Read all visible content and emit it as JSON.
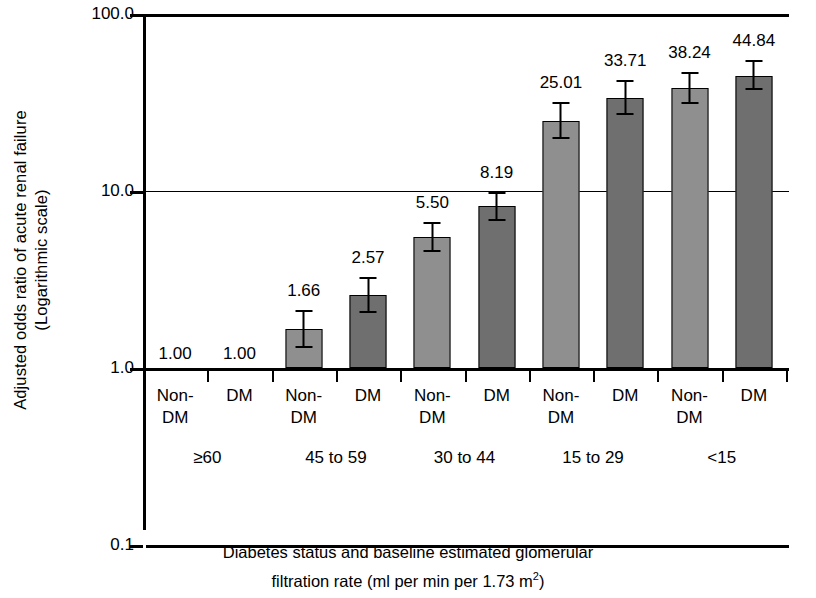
{
  "chart_data": {
    "type": "bar",
    "title": "",
    "xlabel": "Diabetes status and baseline estimated glomerular filtration rate (ml per min per 1.73 m2)",
    "ylabel": "Adjusted odds ratio of acute renal failure (Logarithmic scale)",
    "scale": "log",
    "ylim": [
      0.1,
      100.0
    ],
    "ytick_labels": [
      "100.0",
      "10.0",
      "1.0",
      "0.1"
    ],
    "ytick_values": [
      100.0,
      10.0,
      1.0,
      0.1
    ],
    "grid": true,
    "legend": "none",
    "categories": [
      "Non-DM",
      "DM",
      "Non-DM",
      "DM",
      "Non-DM",
      "DM",
      "Non-DM",
      "DM",
      "Non-DM",
      "DM"
    ],
    "values": [
      1.0,
      1.0,
      1.66,
      2.57,
      5.5,
      8.19,
      25.01,
      33.71,
      38.24,
      44.84
    ],
    "value_labels": [
      "1.00",
      "1.00",
      "1.66",
      "2.57",
      "5.50",
      "8.19",
      "25.01",
      "33.71",
      "38.24",
      "44.84"
    ],
    "error_low": [
      null,
      null,
      1.3,
      2.05,
      4.55,
      6.8,
      19.6,
      27.0,
      31.2,
      37.0
    ],
    "error_high": [
      null,
      null,
      2.12,
      3.25,
      6.7,
      9.9,
      32.0,
      42.5,
      47.0,
      55.0
    ],
    "groups": [
      {
        "label": "≥60",
        "categories": [
          "Non-DM",
          "DM"
        ]
      },
      {
        "label": "45 to 59",
        "categories": [
          "Non-DM",
          "DM"
        ]
      },
      {
        "label": "30 to 44",
        "categories": [
          "Non-DM",
          "DM"
        ]
      },
      {
        "label": "15 to 29",
        "categories": [
          "Non-DM",
          "DM"
        ]
      },
      {
        "label": "<15",
        "categories": [
          "Non-DM",
          "DM"
        ]
      }
    ],
    "colors": {
      "non_dm": "#8f8f8f",
      "dm": "#6f6f6f",
      "axis": "#000000"
    }
  },
  "axes": {
    "y_title_line1": "Adjusted odds ratio of acute renal failure",
    "y_title_line2": "(Logarithmic scale)",
    "x_title_line1": "Diabetes status and baseline estimated glomerular",
    "x_title_line2_a": "filtration rate (ml per min per 1.73 m",
    "x_title_line2_sup": "2",
    "x_title_line2_b": ")",
    "ytick_0": "100.0",
    "ytick_1": "10.0",
    "ytick_2": "1.0",
    "ytick_3": "0.1"
  },
  "cat_labels": [
    {
      "line1": "Non-",
      "line2": "DM"
    },
    {
      "line1": "DM",
      "line2": ""
    },
    {
      "line1": "Non-",
      "line2": "DM"
    },
    {
      "line1": "DM",
      "line2": ""
    },
    {
      "line1": "Non-",
      "line2": "DM"
    },
    {
      "line1": "DM",
      "line2": ""
    },
    {
      "line1": "Non-",
      "line2": "DM"
    },
    {
      "line1": "DM",
      "line2": ""
    },
    {
      "line1": "Non-",
      "line2": "DM"
    },
    {
      "line1": "DM",
      "line2": ""
    }
  ],
  "group_labels": [
    "≥60",
    "45 to 59",
    "30 to 44",
    "15 to 29",
    "<15"
  ],
  "bar_value_labels": [
    "1.00",
    "1.00",
    "1.66",
    "2.57",
    "5.50",
    "8.19",
    "25.01",
    "33.71",
    "38.24",
    "44.84"
  ]
}
